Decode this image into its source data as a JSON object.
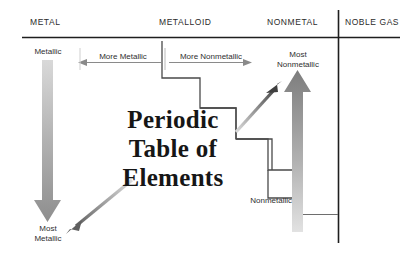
{
  "diagram": {
    "title_lines": [
      "Periodic",
      "Table of",
      "Elements"
    ],
    "title_full": "Periodic Table of Elements",
    "headers": [
      {
        "id": "metal",
        "label": "METAL"
      },
      {
        "id": "metalloid",
        "label": "METALLOID"
      },
      {
        "id": "nonmetal",
        "label": "NONMETAL"
      },
      {
        "id": "noble-gas",
        "label": "NOBLE GAS"
      }
    ],
    "labels": {
      "metallic": "Metallic",
      "most_metallic_line1": "Most",
      "most_metallic_line2": "Metallic",
      "more_metallic": "More Metallic",
      "more_nonmetallic": "More Nonmetallic",
      "most_nonmetallic_line1": "Most",
      "most_nonmetallic_line2": "Nonmetallic",
      "nonmetallic": "Nonmetallic"
    },
    "colors": {
      "ink": "#2b2b2b",
      "title": "#161616",
      "rule": "#1e1e1e",
      "arrow_gray_dark": "#6b6b6b",
      "arrow_gray_light": "#d8d8d8",
      "staircase": "#4a4a4a",
      "leader": "#6e6e6e"
    },
    "background": "#ffffff"
  }
}
